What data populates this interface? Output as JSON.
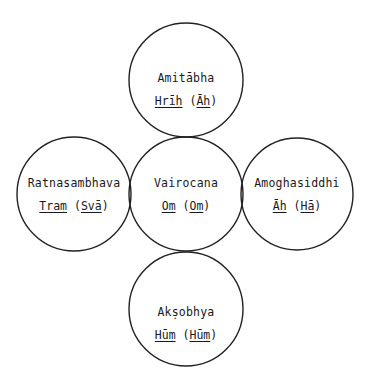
{
  "diagram": {
    "type": "five-circle mandala (cross arrangement)",
    "stroke_color": "#222222",
    "nodes": {
      "top": {
        "name": "Amitābha",
        "seed": "Hrīḥ",
        "alt_seed": "Āḥ"
      },
      "left": {
        "name": "Ratnasambhava",
        "seed": "Traṃ",
        "alt_seed": "Svā"
      },
      "center": {
        "name": "Vairocana",
        "seed": "Oṃ",
        "alt_seed": "Oṃ"
      },
      "right": {
        "name": "Amoghasiddhi",
        "seed": "Āḥ",
        "alt_seed": "Hā"
      },
      "bottom": {
        "name": "Akṣobhya",
        "seed": "Hūṃ",
        "alt_seed": "Hūṃ"
      }
    },
    "punct": {
      "open": "(",
      "close": ")"
    }
  }
}
